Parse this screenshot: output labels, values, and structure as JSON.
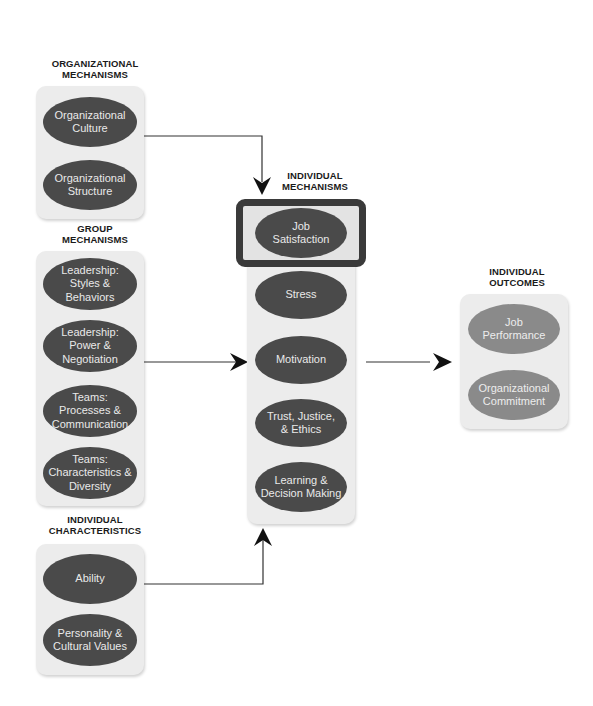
{
  "groups": {
    "organizational_mechanisms": {
      "title_line1": "ORGANIZATIONAL",
      "title_line2": "MECHANISMS",
      "items": [
        "Organizational Culture",
        "Organizational Structure"
      ]
    },
    "group_mechanisms": {
      "title_line1": "GROUP",
      "title_line2": "MECHANISMS",
      "items": [
        "Leadership: Styles & Behaviors",
        "Leadership: Power & Negotiation",
        "Teams: Processes & Communication",
        "Teams: Characteristics & Diversity"
      ]
    },
    "individual_characteristics": {
      "title_line1": "INDIVIDUAL",
      "title_line2": "CHARACTERISTICS",
      "items": [
        "Ability",
        "Personality & Cultural Values"
      ]
    },
    "individual_mechanisms": {
      "title_line1": "INDIVIDUAL",
      "title_line2": "MECHANISMS",
      "highlighted": "Job Satisfaction",
      "items": [
        "Job Satisfaction",
        "Stress",
        "Motivation",
        "Trust, Justice, & Ethics",
        "Learning & Decision Making"
      ]
    },
    "individual_outcomes": {
      "title_line1": "INDIVIDUAL",
      "title_line2": "OUTCOMES",
      "items": [
        "Job Performance",
        "Organizational Commitment"
      ]
    }
  },
  "ovals": {
    "org_culture": {
      "l1": "Organizational",
      "l2": "Culture"
    },
    "org_structure": {
      "l1": "Organizational",
      "l2": "Structure"
    },
    "lead_styles": {
      "l1": "Leadership:",
      "l2": "Styles &",
      "l3": "Behaviors"
    },
    "lead_power": {
      "l1": "Leadership:",
      "l2": "Power &",
      "l3": "Negotiation"
    },
    "teams_proc": {
      "l1": "Teams:",
      "l2": "Processes &",
      "l3": "Communication"
    },
    "teams_char": {
      "l1": "Teams:",
      "l2": "Characteristics &",
      "l3": "Diversity"
    },
    "ability": {
      "l1": "Ability"
    },
    "personality": {
      "l1": "Personality  &",
      "l2": "Cultural Values"
    },
    "job_sat": {
      "l1": "Job",
      "l2": "Satisfaction"
    },
    "stress": {
      "l1": "Stress"
    },
    "motivation": {
      "l1": "Motivation"
    },
    "trust": {
      "l1": "Trust, Justice,",
      "l2": "& Ethics"
    },
    "learning": {
      "l1": "Learning &",
      "l2": "Decision Making"
    },
    "job_perf": {
      "l1": "Job",
      "l2": "Performance"
    },
    "org_commit": {
      "l1": "Organizational",
      "l2": "Commitment"
    }
  },
  "colors": {
    "panel": "#ececec",
    "oval_dark": "#4a4a4a",
    "oval_light": "#8a8a8a",
    "highlight_border": "#3a3a3a",
    "arrow": "#1a1a1a"
  }
}
